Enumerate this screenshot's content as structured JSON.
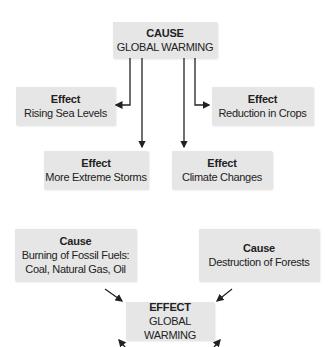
{
  "diagram_1": {
    "cause": {
      "title": "CAUSE",
      "text": "GLOBAL WARMING"
    },
    "effects": [
      {
        "title": "Effect",
        "text": "Rising Sea Levels"
      },
      {
        "title": "Effect",
        "text": "Reduction in Crops"
      },
      {
        "title": "Effect",
        "text": "More Extreme Storms"
      },
      {
        "title": "Effect",
        "text": "Climate Changes"
      }
    ]
  },
  "diagram_2": {
    "causes": [
      {
        "title": "Cause",
        "line1": "Burning of Fossil Fuels:",
        "line2": "Coal, Natural Gas, Oil"
      },
      {
        "title": "Cause",
        "text": "Destruction of Forests"
      }
    ],
    "effect": {
      "title": "EFFECT",
      "text": "GLOBAL WARMING"
    }
  },
  "colors": {
    "box": "#e6e6e6",
    "arrow": "#222222"
  }
}
